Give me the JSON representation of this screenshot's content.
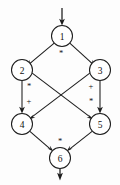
{
  "diagram": {
    "type": "directed-acyclic-graph",
    "title": "",
    "colors": {
      "stroke": "#1c1c1c",
      "node_fill": "#ffffff",
      "background": "#fdfdfd",
      "text": "#101010"
    },
    "nodes": [
      {
        "id": "1",
        "label": "1",
        "cx": 62,
        "cy": 36,
        "r": 10.5
      },
      {
        "id": "2",
        "label": "2",
        "cx": 22,
        "cy": 70,
        "r": 10.5
      },
      {
        "id": "3",
        "label": "3",
        "cx": 100,
        "cy": 70,
        "r": 10.5
      },
      {
        "id": "4",
        "label": "4",
        "cx": 22,
        "cy": 124,
        "r": 10.5
      },
      {
        "id": "5",
        "label": "5",
        "cx": 100,
        "cy": 124,
        "r": 10.5
      },
      {
        "id": "6",
        "label": "6",
        "cx": 60,
        "cy": 158,
        "r": 10.5
      }
    ],
    "edges": [
      {
        "id": "e-1-2",
        "from": "1",
        "to": "2",
        "label": ""
      },
      {
        "id": "e-1-3",
        "from": "1",
        "to": "3",
        "label": ""
      },
      {
        "id": "e-2-4",
        "from": "2",
        "to": "4",
        "label": ""
      },
      {
        "id": "e-2-5",
        "from": "2",
        "to": "5",
        "label": ""
      },
      {
        "id": "e-3-4",
        "from": "3",
        "to": "4",
        "label": ""
      },
      {
        "id": "e-3-5",
        "from": "3",
        "to": "5",
        "label": ""
      },
      {
        "id": "e-4-6",
        "from": "4",
        "to": "6",
        "label": ""
      },
      {
        "id": "e-5-6",
        "from": "5",
        "to": "6",
        "label": ""
      }
    ],
    "edge_labels": [
      {
        "id": "lbl-top",
        "text": "*",
        "x": 61,
        "y": 53
      },
      {
        "id": "lbl-left-upper",
        "text": "*",
        "x": 29,
        "y": 86
      },
      {
        "id": "lbl-left-lower",
        "text": "+",
        "x": 29,
        "y": 101
      },
      {
        "id": "lbl-right-upper",
        "text": "+",
        "x": 91,
        "y": 86
      },
      {
        "id": "lbl-right-lower",
        "text": "*",
        "x": 91,
        "y": 101
      },
      {
        "id": "lbl-bottom",
        "text": "*",
        "x": 60,
        "y": 141
      }
    ],
    "io": {
      "input_arrow": {
        "id": "input-arrow",
        "x": 62,
        "y_start": 8,
        "y_end": 25
      },
      "output_arrow": {
        "id": "output-arrow",
        "x": 60,
        "y_start": 169,
        "y_end": 180
      }
    }
  }
}
